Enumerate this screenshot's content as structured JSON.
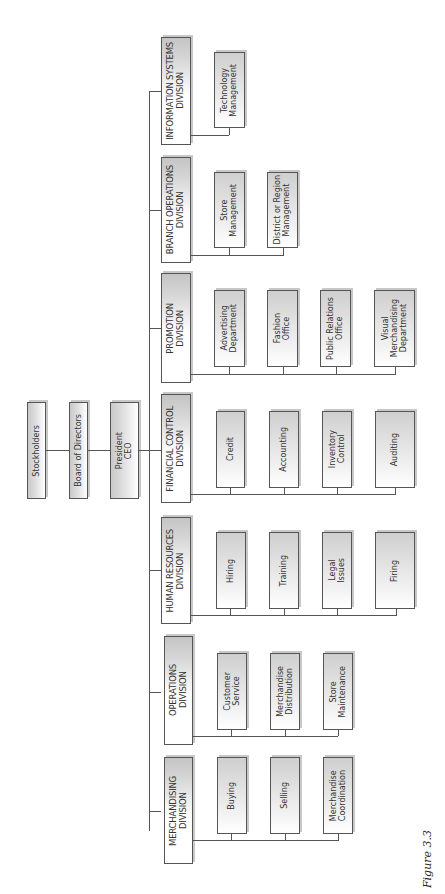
{
  "executives": [
    {
      "label": "Stockholders"
    },
    {
      "label": "Board of Directors"
    },
    {
      "label": "President\nCEO"
    }
  ],
  "divisions": [
    {
      "label": "INFORMATION SYSTEMS\nDIVISION",
      "units": [
        "Technology\nManagement"
      ]
    },
    {
      "label": "BRANCH OPERATIONS\nDIVISION",
      "units": [
        "Store\nManagement",
        "District or Region\nManagement"
      ]
    },
    {
      "label": "PROMOTION\nDIVISION",
      "units": [
        "Advertising\nDepartment",
        "Fashion\nOffice",
        "Public Relations\nOffice",
        "Visual\nMerchandising\nDepartment"
      ]
    },
    {
      "label": "FINANCIAL CONTROL\nDIVISION",
      "units": [
        "Credit",
        "Accounting",
        "Inventory\nControl",
        "Auditing"
      ]
    },
    {
      "label": "HUMAN RESOURCES\nDIVISION",
      "units": [
        "Hiring",
        "Training",
        "Legal\nIssues",
        "Firing"
      ]
    },
    {
      "label": "OPERATIONS\nDIVISION",
      "units": [
        "Customer\nService",
        "Merchandise\nDistribution",
        "Store\nMaintenance"
      ]
    },
    {
      "label": "MERCHANDISING\nDIVISION",
      "units": [
        "Buying",
        "Selling",
        "Merchandise\nCoordination"
      ]
    }
  ],
  "caption": "Figure 3.3"
}
